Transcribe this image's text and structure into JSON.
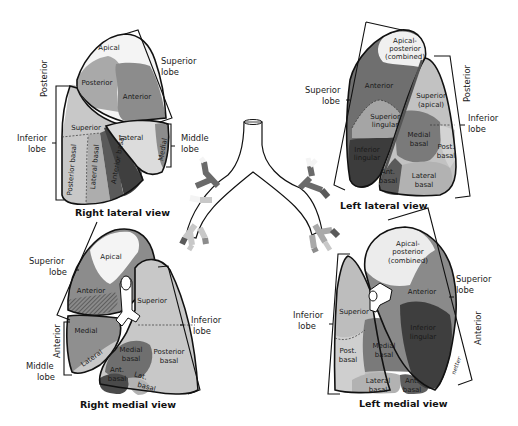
{
  "colors": {
    "white_segment": "#f4f4f4",
    "light_gray": "#c8c8c8",
    "mid_gray": "#a9a9a9",
    "dark_gray": "#7c7c7c",
    "darker_gray": "#5d5d5d",
    "darkest": "#3a3a3a",
    "outline": "#111111"
  },
  "right_lateral": {
    "title": "Right lateral view",
    "labels": {
      "superior_lobe": [
        "Superior",
        "lobe"
      ],
      "middle_lobe": [
        "Middle",
        "lobe"
      ],
      "inferior_lobe": [
        "Inferior",
        "lobe"
      ],
      "posterior": "Posterior"
    },
    "segments": {
      "apical": "Apical",
      "posterior": "Posterior",
      "anterior": "Anterior",
      "superior": "Superior",
      "lateral": "Lateral",
      "medial": "Medial",
      "posterior_basal": "Posterior basal",
      "lateral_basal": "Lateral basal",
      "anterior_basal": "Anterior basal"
    }
  },
  "left_lateral": {
    "title": "Left lateral view",
    "labels": {
      "superior_lobe": [
        "Superior",
        "lobe"
      ],
      "inferior_lobe": [
        "Inferior",
        "lobe"
      ],
      "posterior": "Posterior"
    },
    "segments": {
      "apical_posterior": [
        "Apical-",
        "posterior",
        "(combined)"
      ],
      "anterior": "Anterior",
      "superior_lingular": [
        "Superior",
        "lingular"
      ],
      "inferior_lingular": [
        "Inferior",
        "lingular"
      ],
      "superior_apical": [
        "Superior",
        "(apical)"
      ],
      "medial_basal": [
        "Medial",
        "basal"
      ],
      "post_basal": [
        "Post.",
        "basal"
      ],
      "ant_basal": [
        "Ant.",
        "basal"
      ],
      "lateral_basal": [
        "Lateral",
        "basal"
      ]
    }
  },
  "right_medial": {
    "title": "Right medial view",
    "labels": {
      "superior_lobe": [
        "Superior",
        "lobe"
      ],
      "inferior_lobe": [
        "Inferior",
        "lobe"
      ],
      "middle_lobe": [
        "Middle",
        "lobe"
      ],
      "anterior": "Anterior"
    },
    "segments": {
      "apical": "Apical",
      "anterior": "Anterior",
      "superior": "Superior",
      "medial": "Medial",
      "lateral": "Lateral",
      "medial_basal": [
        "Medial",
        "basal"
      ],
      "posterior_basal": [
        "Posterior",
        "basal"
      ],
      "ant_basal": [
        "Ant.",
        "basal"
      ],
      "lat_basal": [
        "Lat.",
        "basal"
      ]
    }
  },
  "left_medial": {
    "title": "Left medial view",
    "labels": {
      "superior_lobe": [
        "Superior",
        "lobe"
      ],
      "inferior_lobe": [
        "Inferior",
        "lobe"
      ],
      "anterior": "Anterior"
    },
    "segments": {
      "apical_posterior": [
        "Apical-",
        "posterior",
        "(combined)"
      ],
      "anterior": "Anterior",
      "superior": "Superior",
      "inferior_lingular": [
        "Inferior",
        "lingular"
      ],
      "post_basal": [
        "Post.",
        "basal"
      ],
      "medial_basal": [
        "Medial",
        "basal"
      ],
      "lateral_basal": [
        "Lateral",
        "basal"
      ],
      "ant_basal": [
        "Ant.",
        "basal"
      ]
    },
    "signature": "netter"
  }
}
